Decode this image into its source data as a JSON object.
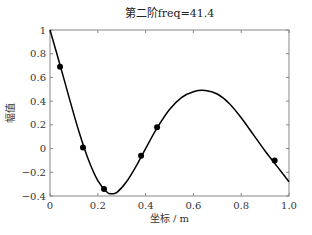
{
  "chart_data": {
    "type": "line",
    "title": "第二阶freq=41.4",
    "xlabel": "坐标 / m",
    "ylabel": "幅值",
    "xlim": [
      0,
      1
    ],
    "ylim": [
      -0.4,
      1
    ],
    "x_ticks": [
      0,
      0.2,
      0.4,
      0.6,
      0.8,
      1.0
    ],
    "x_tick_labels": [
      "0",
      "0.2",
      "0.4",
      "0.6",
      "0.8",
      "1.0"
    ],
    "y_ticks": [
      -0.4,
      -0.2,
      0,
      0.2,
      0.4,
      0.6,
      0.8,
      1
    ],
    "y_tick_labels": [
      "−0.4",
      "−0.2",
      "0",
      "0.2",
      "0.4",
      "0.6",
      "0.8",
      "1"
    ],
    "grid": false,
    "legend": null,
    "series": [
      {
        "name": "mode shape",
        "style": "line",
        "color": "#000000",
        "x": [
          0,
          0.04,
          0.08,
          0.12,
          0.16,
          0.2,
          0.24,
          0.26,
          0.28,
          0.32,
          0.36,
          0.4,
          0.45,
          0.5,
          0.55,
          0.6,
          0.65,
          0.7,
          0.75,
          0.8,
          0.85,
          0.9,
          0.95,
          1.0
        ],
        "y": [
          1.0,
          0.72,
          0.43,
          0.15,
          -0.09,
          -0.27,
          -0.37,
          -0.38,
          -0.37,
          -0.28,
          -0.15,
          0.0,
          0.18,
          0.33,
          0.43,
          0.48,
          0.49,
          0.46,
          0.38,
          0.26,
          0.12,
          -0.02,
          -0.15,
          -0.28
        ]
      },
      {
        "name": "sensor points",
        "style": "scatter",
        "color": "#000000",
        "x": [
          0.042,
          0.138,
          0.226,
          0.381,
          0.448,
          0.94
        ],
        "y": [
          0.69,
          0.01,
          -0.34,
          -0.06,
          0.18,
          -0.1
        ]
      }
    ]
  }
}
